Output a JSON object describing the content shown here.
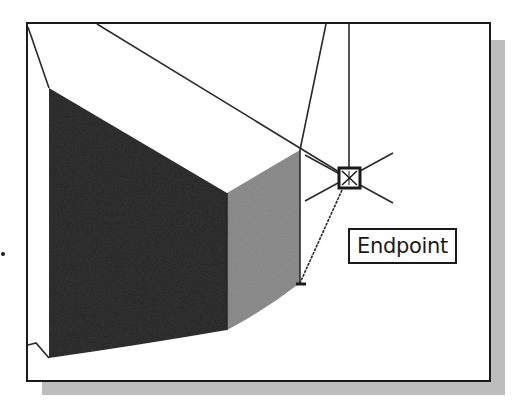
{
  "figure": {
    "snap_tooltip": {
      "label": "Endpoint"
    },
    "snap_marker": {
      "icon": "endpoint-snap-box-icon",
      "cursor": "crosshair-icon"
    },
    "colors": {
      "frame_border": "#1a1a1a",
      "shadow": "#bdbdbd",
      "dark_face": "#2e2e2e",
      "light_face": "#8e8e8e",
      "background": "#ffffff",
      "edges": "#2a2a2a"
    }
  }
}
